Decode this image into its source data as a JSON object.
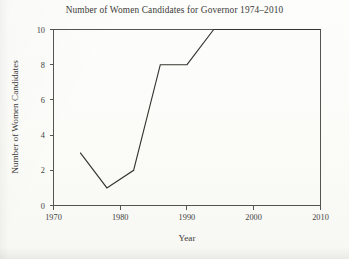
{
  "figure": {
    "background_color": "#fbfbf8",
    "ink_color": "#35342f",
    "axis_color": "#55544f"
  },
  "chart_data": {
    "type": "line",
    "title": "Number of Women Candidates for Governor 1974–2010",
    "xlabel": "Year",
    "ylabel": "Number of Women Candidates",
    "xlim": [
      1970,
      2010
    ],
    "ylim": [
      0,
      10
    ],
    "grid": false,
    "legend": false,
    "xticks": [
      1970,
      1980,
      1990,
      2000,
      2010
    ],
    "xtick_labels": [
      "1970",
      "1980",
      "1990",
      "2000",
      "2010"
    ],
    "yticks": [
      0,
      2,
      4,
      6,
      8,
      10
    ],
    "ytick_labels": [
      "0",
      "2",
      "4",
      "6",
      "8",
      "10"
    ],
    "x": [
      1974,
      1978,
      1982,
      1986,
      1990,
      1994,
      1998,
      2002,
      2006,
      2010
    ],
    "values": [
      3,
      1,
      2,
      8,
      8,
      10,
      10,
      10,
      10,
      10
    ],
    "series": [
      {
        "name": "Women Candidates",
        "x": [
          1974,
          1978,
          1982,
          1986,
          1990,
          1994,
          1998,
          2002,
          2006,
          2010
        ],
        "values": [
          3,
          1,
          2,
          8,
          8,
          10,
          10,
          10,
          10,
          10
        ],
        "color": "#35342f"
      }
    ]
  }
}
